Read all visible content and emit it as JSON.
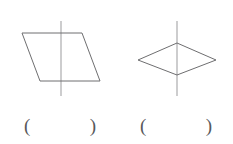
{
  "page": {
    "background_color": "#ffffff",
    "width": 233,
    "height": 144
  },
  "style": {
    "shape_stroke_color": "#6e6e70",
    "axis_stroke_color": "#9b9b9d",
    "paren_color": "#58585a",
    "shape_stroke_width": 1,
    "axis_stroke_width": 1
  },
  "figures": [
    {
      "id": "figure-1",
      "name": "parallelogram",
      "shape_type": "parallelogram",
      "vertices": [
        [
          22,
          33
        ],
        [
          82,
          33
        ],
        [
          100,
          81
        ],
        [
          40,
          81
        ]
      ],
      "axis_line": {
        "name": "vertical-line",
        "x1": 61,
        "y1": 21,
        "x2": 61,
        "y2": 96
      }
    },
    {
      "id": "figure-2",
      "name": "rhombus",
      "shape_type": "rhombus",
      "vertices": [
        [
          177,
          43
        ],
        [
          216,
          60
        ],
        [
          177,
          75
        ],
        [
          138,
          60
        ]
      ],
      "axis_line": {
        "name": "vertical-line",
        "x1": 177,
        "y1": 21,
        "x2": 177,
        "y2": 96
      }
    }
  ],
  "answers": [
    {
      "id": "answer-1",
      "for_figure": "figure-1",
      "open_paren": "(",
      "value": "",
      "close_paren": ")"
    },
    {
      "id": "answer-2",
      "for_figure": "figure-2",
      "open_paren": "(",
      "value": "",
      "close_paren": ")"
    }
  ]
}
